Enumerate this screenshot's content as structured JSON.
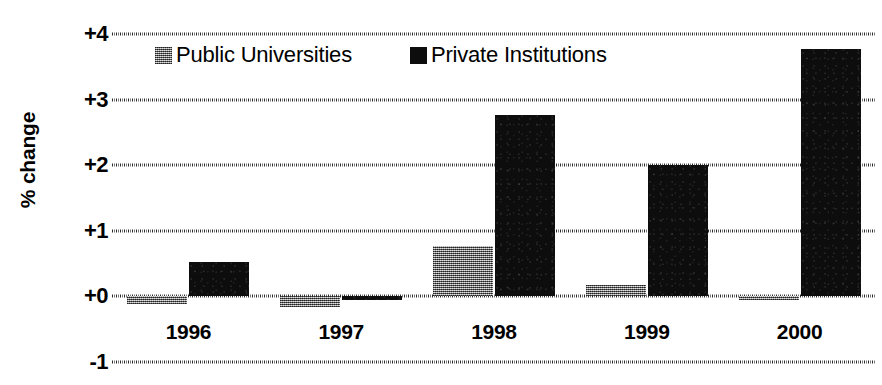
{
  "chart_data": {
    "type": "bar",
    "title": "",
    "xlabel": "",
    "ylabel": "% change",
    "categories": [
      "1996",
      "1997",
      "1998",
      "1999",
      "2000"
    ],
    "series": [
      {
        "name": "Public Universities",
        "color": "#8a8a8a",
        "values": [
          -0.11,
          -0.16,
          0.77,
          0.17,
          -0.06
        ]
      },
      {
        "name": "Private Institutions",
        "color": "#000000",
        "values": [
          0.52,
          -0.05,
          2.77,
          2.0,
          3.77
        ]
      }
    ],
    "ylim": [
      -1,
      4
    ],
    "yticks": [
      4,
      3,
      2,
      1,
      0,
      -1
    ],
    "ytick_labels": [
      "+4",
      "+3",
      "+2",
      "+1",
      "+0",
      "-1"
    ],
    "grid": true,
    "legend_position": "top-inside"
  },
  "legend": {
    "items": [
      {
        "label": "Public Universities",
        "swatch": "public"
      },
      {
        "label": "Private Institutions",
        "swatch": "private"
      }
    ]
  }
}
